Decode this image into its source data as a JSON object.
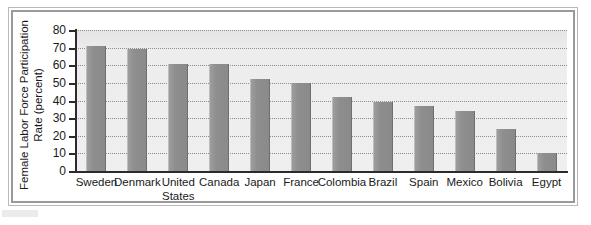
{
  "figure": {
    "background_color": "#ffffff",
    "frame_color": "#9a9a9a",
    "plot_background_color": "#ededed",
    "bar_color": "#8e8e8e",
    "axis_color": "#2b2b2b",
    "gridline_color": "#8c8c8c"
  },
  "chart_data": {
    "type": "bar",
    "title": "",
    "xlabel": "",
    "ylabel": "Female Labor Force Participation Rate (percent)",
    "ylabel_line1": "Female Labor Force Participation",
    "ylabel_line2": "Rate (percent)",
    "ylim": [
      0,
      80
    ],
    "ytick_values": [
      0,
      10,
      20,
      30,
      40,
      50,
      60,
      70,
      80
    ],
    "ytick_labels": [
      "0",
      "10",
      "20",
      "30",
      "40",
      "50",
      "60",
      "70",
      "80"
    ],
    "grid": "horizontal-dotted",
    "legend": "none",
    "categories": [
      "Sweden",
      "Denmark",
      "United States",
      "Canada",
      "Japan",
      "France",
      "Colombia",
      "Brazil",
      "Spain",
      "Mexico",
      "Bolivia",
      "Egypt"
    ],
    "category_labels": [
      [
        "Sweden"
      ],
      [
        "Denmark"
      ],
      [
        "United",
        "States"
      ],
      [
        "Canada"
      ],
      [
        "Japan"
      ],
      [
        "France"
      ],
      [
        "Colombia"
      ],
      [
        "Brazil"
      ],
      [
        "Spain"
      ],
      [
        "Mexico"
      ],
      [
        "Bolivia"
      ],
      [
        "Egypt"
      ]
    ],
    "values": [
      71,
      69,
      61,
      61,
      52,
      50,
      42,
      39,
      37,
      34,
      24,
      10
    ],
    "series": [
      {
        "name": "Female Labor Force Participation Rate",
        "values": [
          71,
          69,
          61,
          61,
          52,
          50,
          42,
          39,
          37,
          34,
          24,
          10
        ]
      }
    ]
  }
}
